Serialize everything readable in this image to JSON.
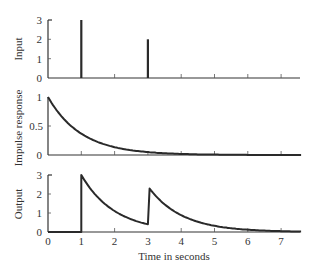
{
  "chart_data": [
    {
      "type": "line",
      "panel": "top",
      "title": "",
      "xlabel": "",
      "ylabel": "Input",
      "xlim": [
        0,
        7.6
      ],
      "ylim": [
        0,
        3
      ],
      "yticks": [
        0,
        1,
        2,
        3
      ],
      "yticklabels": [
        "0",
        "1",
        "2",
        "3"
      ],
      "xticks": [
        0,
        1,
        2,
        3,
        4,
        5,
        6,
        7
      ],
      "grid": false,
      "series": [
        {
          "name": "Input impulses",
          "kind": "impulse",
          "x": [
            1,
            3
          ],
          "values": [
            3,
            2
          ]
        }
      ]
    },
    {
      "type": "line",
      "panel": "middle",
      "title": "",
      "xlabel": "",
      "ylabel": "Impulse response",
      "xlim": [
        0,
        7.6
      ],
      "ylim": [
        0,
        1
      ],
      "yticks": [
        0,
        0.5,
        1
      ],
      "yticklabels": [
        "0",
        "0.5",
        "1"
      ],
      "xticks": [
        0,
        1,
        2,
        3,
        4,
        5,
        6,
        7
      ],
      "grid": false,
      "series": [
        {
          "name": "h(t)",
          "x": [
            0,
            0.5,
            1,
            1.5,
            2,
            2.5,
            3,
            3.5,
            4,
            5,
            6,
            7,
            7.6
          ],
          "values": [
            1,
            0.61,
            0.37,
            0.22,
            0.14,
            0.08,
            0.05,
            0.03,
            0.02,
            0.01,
            0.0,
            0.0,
            0.0
          ]
        }
      ]
    },
    {
      "type": "line",
      "panel": "bottom",
      "title": "",
      "xlabel": "Time in seconds",
      "ylabel": "Output",
      "xlim": [
        0,
        7.6
      ],
      "ylim": [
        0,
        3
      ],
      "yticks": [
        0,
        1,
        2,
        3
      ],
      "yticklabels": [
        "0",
        "1",
        "2",
        "3"
      ],
      "xticks": [
        0,
        1,
        2,
        3,
        4,
        5,
        6,
        7
      ],
      "xticklabels": [
        "0",
        "1",
        "2",
        "3",
        "4",
        "5",
        "6",
        "7"
      ],
      "grid": false,
      "series": [
        {
          "name": "y(t)",
          "x": [
            0,
            1,
            1,
            1.5,
            2,
            2.5,
            3,
            3,
            3.5,
            4,
            4.5,
            5,
            6,
            7,
            7.6
          ],
          "values": [
            0,
            0,
            3,
            1.82,
            1.1,
            0.67,
            0.41,
            2.41,
            1.46,
            0.89,
            0.54,
            0.33,
            0.12,
            0.04,
            0.02
          ]
        }
      ]
    }
  ],
  "labels": {
    "top_ylabel": "Input",
    "mid_ylabel": "Impulse response",
    "bot_ylabel": "Output",
    "xlabel": "Time in seconds",
    "top_y": [
      "0",
      "1",
      "2",
      "3"
    ],
    "mid_y": [
      "0",
      "0.5",
      "1"
    ],
    "bot_y": [
      "0",
      "1",
      "2",
      "3"
    ],
    "x": [
      "0",
      "1",
      "2",
      "3",
      "4",
      "5",
      "6",
      "7"
    ]
  }
}
